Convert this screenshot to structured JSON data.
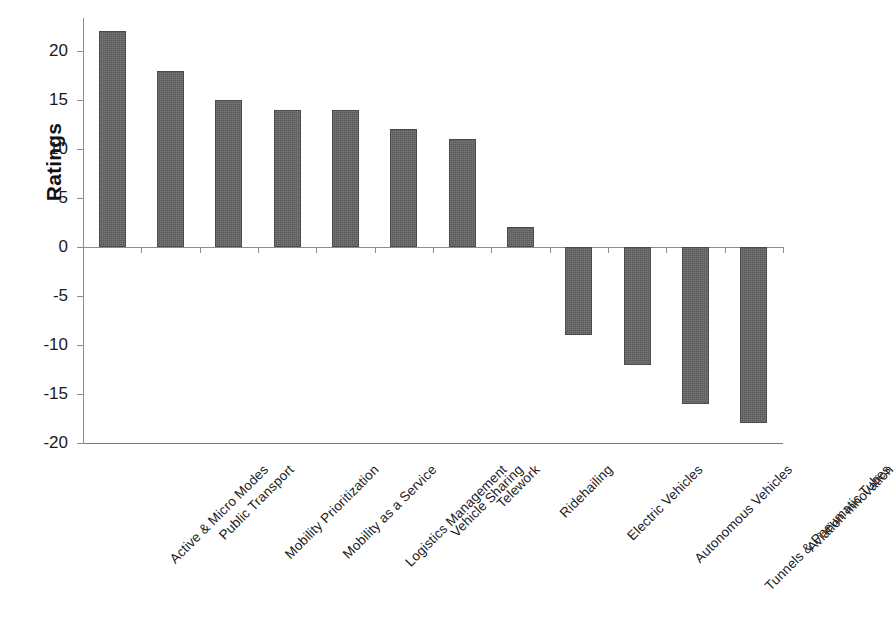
{
  "chart_data": {
    "type": "bar",
    "title": "",
    "xlabel": "",
    "ylabel": "Ratings",
    "ylim": [
      -20,
      22
    ],
    "grid": false,
    "legend": "none",
    "orientation": "vertical",
    "bar_color": "#595959",
    "categories": [
      "Active & Micro Modes",
      "Public Transport",
      "Mobility Prioritization",
      "Mobility as a Service",
      "Logistics Management",
      "Vehicle Sharing",
      "Telework",
      "Ridehailing",
      "Electric Vehicles",
      "Autonomous Vehicles",
      "Tunnels & Pneumatic Tubes",
      "Aviation Innovation"
    ],
    "values": [
      22,
      18,
      15,
      14,
      14,
      12,
      11,
      2,
      -9,
      -12,
      -16,
      -18
    ],
    "ytick_labels": [
      "20",
      "15",
      "10",
      "5",
      "0",
      "-5",
      "-10",
      "-15",
      "-20"
    ],
    "ytick_values": [
      20,
      15,
      10,
      5,
      0,
      -5,
      -10,
      -15,
      -20
    ]
  }
}
